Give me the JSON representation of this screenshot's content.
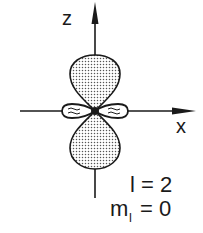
{
  "diagram": {
    "axes": {
      "z_label": "z",
      "x_label": "x"
    },
    "quantum_numbers": {
      "l_text": "l = 2",
      "ml_main": "m",
      "ml_sub": "l",
      "ml_value": " = 0"
    },
    "colors": {
      "ink": "#1a1a1a",
      "dot_fill": "#555555",
      "background": "#ffffff"
    }
  }
}
